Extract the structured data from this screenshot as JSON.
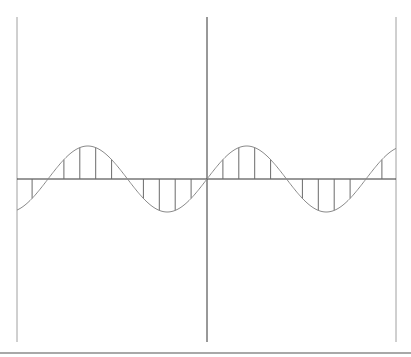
{
  "chart_data": {
    "type": "line",
    "title": "",
    "xlabel": "",
    "ylabel": "",
    "grid": false,
    "legend": null,
    "xlim": [
      -12,
      12
    ],
    "ylim": [
      -5,
      5
    ],
    "series": [
      {
        "name": "continuous",
        "style": "line",
        "function": "sin(2*pi*n/10)",
        "amplitude": 1,
        "period_samples": 10
      },
      {
        "name": "sampled",
        "style": "stem",
        "n": [
          -11,
          -10,
          -9,
          -8,
          -7,
          -6,
          -5,
          -4,
          -3,
          -2,
          -1,
          0,
          1,
          2,
          3,
          4,
          5,
          6,
          7,
          8,
          9,
          10,
          11,
          12
        ],
        "values": [
          -0.588,
          0,
          0.588,
          0.951,
          0.951,
          0.588,
          0,
          -0.588,
          -0.951,
          -0.951,
          -0.588,
          0,
          0.588,
          0.951,
          0.951,
          0.588,
          0,
          -0.588,
          -0.951,
          -0.951,
          -0.588,
          0,
          0.588,
          0.951
        ]
      }
    ]
  },
  "layout": {
    "axis_color": "#333333",
    "curve_color": "#8a8a8a",
    "stem_color": "#6a6a6a",
    "frame_color": "#a0a0a0",
    "origin_x": 207,
    "origin_y": 179,
    "left_x": 17,
    "right_x": 396,
    "top_y": 17,
    "bottom_y": 342,
    "px_per_sample": 15.9,
    "amp_px": 33
  }
}
